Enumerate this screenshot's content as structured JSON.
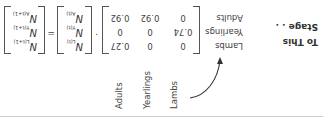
{
  "heading": {
    "line1": "To This",
    "line2": "Stage . ."
  },
  "column_labels": [
    "Lambs",
    "Yearlings",
    "Adults"
  ],
  "row_labels": [
    "Lambs",
    "Yearlings",
    "Adults"
  ],
  "matrix": [
    [
      "0",
      "0",
      "0.27"
    ],
    [
      "0.74",
      "0",
      "0"
    ],
    [
      "0",
      "0.92",
      "0.92"
    ]
  ],
  "operators": {
    "multiply": "·",
    "equals": "="
  },
  "vector_t": [
    {
      "symbol": "N",
      "subscript": "L(t)"
    },
    {
      "symbol": "N",
      "subscript": "Y(t)"
    },
    {
      "symbol": "N",
      "subscript": "A(t)"
    }
  ],
  "vector_t1": [
    {
      "symbol": "N",
      "subscript": "L(t+1)"
    },
    {
      "symbol": "N",
      "subscript": "Y(t+1)"
    },
    {
      "symbol": "N",
      "subscript": "A(t+1)"
    }
  ],
  "orientation": "rotated 180 degrees"
}
